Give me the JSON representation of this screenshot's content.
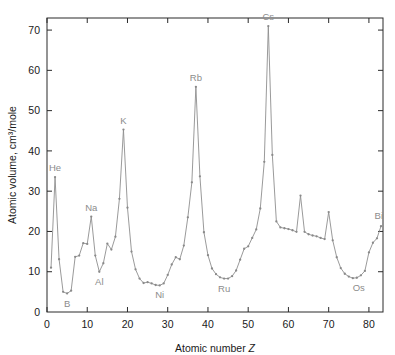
{
  "chart_data": {
    "type": "line",
    "title": "",
    "xlabel": "Atomic number Z",
    "ylabel": "Atomic volume, cm³/mole",
    "xlim": [
      0,
      83.5
    ],
    "ylim": [
      0,
      73
    ],
    "xticks": [
      0,
      10,
      20,
      30,
      40,
      50,
      60,
      70,
      80
    ],
    "yticks": [
      10,
      20,
      30,
      40,
      50,
      60,
      70
    ],
    "grid": false,
    "legend": null,
    "line_color": "#8f8f8f",
    "marker_color": "#8a8a8a",
    "axis_color": "#2a2a2a",
    "annotation_color": "#8c8c8c",
    "x": [
      1,
      2,
      3,
      4,
      5,
      6,
      7,
      8,
      9,
      10,
      11,
      12,
      13,
      14,
      15,
      16,
      17,
      18,
      19,
      20,
      21,
      22,
      23,
      24,
      25,
      26,
      27,
      28,
      29,
      30,
      31,
      32,
      33,
      34,
      35,
      36,
      37,
      38,
      39,
      40,
      41,
      42,
      43,
      44,
      45,
      46,
      47,
      48,
      49,
      50,
      51,
      52,
      53,
      54,
      55,
      56,
      57,
      58,
      59,
      60,
      61,
      62,
      63,
      64,
      65,
      66,
      67,
      68,
      69,
      70,
      71,
      72,
      73,
      74,
      75,
      76,
      77,
      78,
      79,
      80,
      81,
      82,
      83
    ],
    "values": [
      11.0,
      33.5,
      13.1,
      5.0,
      4.6,
      5.3,
      13.7,
      14.0,
      17.1,
      16.9,
      23.7,
      14.0,
      10.0,
      12.1,
      17.0,
      15.5,
      18.7,
      28.1,
      45.3,
      25.9,
      15.0,
      10.6,
      8.3,
      7.2,
      7.4,
      7.1,
      6.7,
      6.6,
      7.1,
      9.2,
      11.8,
      13.6,
      13.1,
      16.5,
      23.5,
      32.2,
      55.9,
      33.7,
      19.8,
      14.1,
      10.8,
      9.4,
      8.6,
      8.3,
      8.3,
      8.9,
      10.3,
      13.0,
      15.7,
      16.3,
      18.4,
      20.5,
      25.7,
      37.3,
      71.0,
      39.0,
      22.5,
      21.0,
      20.8,
      20.6,
      20.3,
      19.9,
      28.9,
      19.9,
      19.3,
      19.0,
      18.8,
      18.4,
      18.1,
      24.8,
      17.8,
      13.6,
      10.9,
      9.5,
      8.8,
      8.4,
      8.5,
      9.1,
      10.2,
      14.8,
      17.2,
      18.3,
      21.3
    ],
    "annotations": [
      {
        "label": "He",
        "z": 2,
        "value": 33.5
      },
      {
        "label": "B",
        "z": 5,
        "value": 4.6
      },
      {
        "label": "Na",
        "z": 11,
        "value": 23.7
      },
      {
        "label": "Al",
        "z": 13,
        "value": 10.0
      },
      {
        "label": "K",
        "z": 19,
        "value": 45.3
      },
      {
        "label": "Ni",
        "z": 28,
        "value": 6.6
      },
      {
        "label": "Rb",
        "z": 37,
        "value": 55.9
      },
      {
        "label": "Ru",
        "z": 44,
        "value": 8.3
      },
      {
        "label": "Cs",
        "z": 55,
        "value": 71.0
      },
      {
        "label": "Os",
        "z": 76,
        "value": 8.4
      },
      {
        "label": "Bi",
        "z": 83,
        "value": 21.3
      }
    ]
  }
}
